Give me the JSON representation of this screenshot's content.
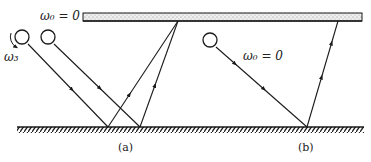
{
  "figure": {
    "top_plate_label": "ω₀ = 0",
    "spin_label": "ω₃",
    "panel_b_label": "ω₀ = 0",
    "caption_a": "(a)",
    "caption_b": "(b)"
  },
  "colors": {
    "ink": "#1a1a1a",
    "plate_fill": "#ececec",
    "background": "#ffffff"
  }
}
